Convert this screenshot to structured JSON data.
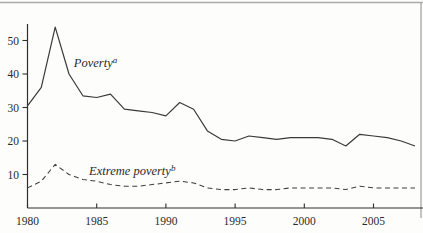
{
  "figure": {
    "name": "poverty-extreme-poverty-trend-chart",
    "background": "#fdfdfb",
    "scan_border_color": "#ababab",
    "axis_color": "#2e2e2e",
    "text_color": "#2b2b2b"
  },
  "chart_data": {
    "type": "line",
    "title": "",
    "xlabel": "",
    "ylabel": "",
    "grid": false,
    "legend": "inline-annotations",
    "xlim": [
      1980,
      2008.6
    ],
    "ylim": [
      0,
      55
    ],
    "x_ticks": [
      1980,
      1985,
      1990,
      1995,
      2000,
      2005
    ],
    "y_ticks": [
      10,
      20,
      30,
      40,
      50
    ],
    "x": [
      1980,
      1981,
      1982,
      1983,
      1984,
      1985,
      1986,
      1987,
      1988,
      1989,
      1990,
      1991,
      1992,
      1993,
      1994,
      1995,
      1996,
      1997,
      1998,
      1999,
      2000,
      2001,
      2002,
      2003,
      2004,
      2005,
      2006,
      2007,
      2008
    ],
    "series": [
      {
        "name": "poverty",
        "label": "Poverty",
        "label_sup": "a",
        "style": "solid",
        "color": "#3a3a3a",
        "values": [
          30.5,
          36,
          54,
          40,
          33.5,
          33,
          34,
          29.5,
          29,
          28.5,
          27.5,
          31.5,
          29.5,
          23,
          20.5,
          20,
          21.5,
          21,
          20.5,
          21,
          21,
          21,
          20.5,
          18.5,
          22,
          21.5,
          21,
          20,
          18.5
        ]
      },
      {
        "name": "extreme-poverty",
        "label": "Extreme poverty",
        "label_sup": "b",
        "style": "dashed",
        "color": "#3f3f3f",
        "values": [
          6,
          8,
          13,
          10,
          8.5,
          8,
          7,
          6.5,
          6.5,
          7,
          7.5,
          8,
          7.5,
          6,
          5.5,
          5.5,
          6,
          5.5,
          5.5,
          6,
          6,
          6,
          6,
          5.5,
          6.5,
          6,
          6,
          6,
          6
        ]
      }
    ],
    "annotations": [
      {
        "series": "poverty",
        "text": "Poverty",
        "sup": "a",
        "x": 1983.35,
        "y": 42,
        "italic": true
      },
      {
        "series": "extreme-poverty",
        "text": "Extreme poverty",
        "sup": "b",
        "x": 1984.45,
        "y": 9.8,
        "italic": true
      }
    ]
  }
}
